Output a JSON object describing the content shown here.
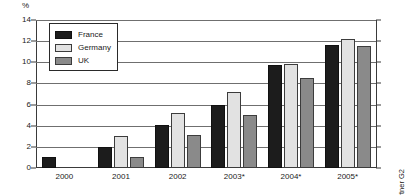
{
  "chart_data": {
    "type": "bar",
    "title": "",
    "subtitle": "",
    "xlabel": "",
    "ylabel": "%",
    "unit_label": "%",
    "categories": [
      "2000",
      "2001",
      "2002",
      "2003*",
      "2004*",
      "2005*"
    ],
    "series": [
      {
        "name": "France",
        "color": "#1c1c1c",
        "values": [
          1,
          2,
          4.1,
          6.0,
          9.7,
          11.6
        ]
      },
      {
        "name": "Germany",
        "color": "#e2e2e2",
        "values": [
          null,
          3,
          5.2,
          7.2,
          9.8,
          12.2
        ]
      },
      {
        "name": "UK",
        "color": "#8a8a8a",
        "values": [
          null,
          1,
          3.1,
          5.0,
          8.5,
          11.5
        ]
      }
    ],
    "ylim": [
      0,
      14
    ],
    "yticks": [
      0,
      2,
      4,
      6,
      8,
      10,
      12,
      14
    ],
    "ytick_labels": [
      "0",
      "2",
      "4",
      "6",
      "8",
      "10",
      "12",
      "14"
    ],
    "grid": true,
    "grid_orientation": "horizontal",
    "legend_position": "top-left",
    "annotations": [
      "*estimate. Source: Gartner G2"
    ]
  },
  "legend": {
    "items": [
      {
        "label": "France",
        "swatch": "france"
      },
      {
        "label": "Germany",
        "swatch": "germany"
      },
      {
        "label": "UK",
        "swatch": "uk"
      }
    ]
  },
  "source_note": "*estimate. Source: Gartner G2"
}
